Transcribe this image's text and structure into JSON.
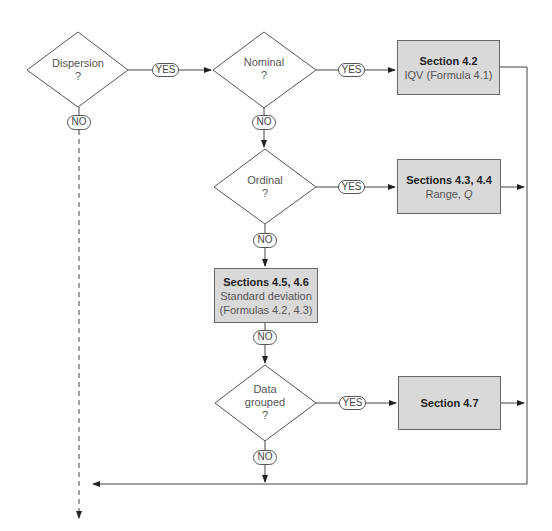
{
  "diagram": {
    "decisions": [
      {
        "id": "dispersion",
        "line1": "Dispersion",
        "line2": "?",
        "line3": ""
      },
      {
        "id": "nominal",
        "line1": "Nominal",
        "line2": "?",
        "line3": ""
      },
      {
        "id": "ordinal",
        "line1": "Ordinal",
        "line2": "?",
        "line3": ""
      },
      {
        "id": "grouped",
        "line1": "Data",
        "line2": "grouped",
        "line3": "?"
      }
    ],
    "boxes": [
      {
        "id": "sec42",
        "title": "Section 4.2",
        "sub1": "IQV (Formula 4.1)",
        "sub2": ""
      },
      {
        "id": "sec4344",
        "title": "Sections 4.3, 4.4",
        "sub1": "Range, Q",
        "sub2": ""
      },
      {
        "id": "sec4546",
        "title": "Sections 4.5, 4.6",
        "sub1": "Standard deviation",
        "sub2": "(Formulas 4.2, 4.3)"
      },
      {
        "id": "sec47",
        "title": "Section 4.7",
        "sub1": "",
        "sub2": ""
      }
    ],
    "labels": {
      "yes": "YES",
      "no": "NO"
    },
    "colors": {
      "box_fill": "#d9d9d9",
      "line": "#444444"
    }
  }
}
